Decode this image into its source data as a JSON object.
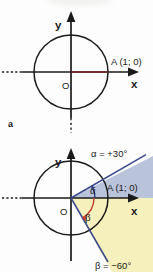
{
  "document": {
    "type": "math-figure",
    "description": "Unit circle diagrams showing point A and directed angles"
  },
  "figure_a": {
    "caption": "a",
    "axis_x_label": "x",
    "axis_y_label": "y",
    "origin_label": "O",
    "point_label": "A (1; 0)",
    "radius_color": "#7a2424",
    "circle_color": "#1a1a1a",
    "axis_color": "#1a1a1a"
  },
  "figure_b": {
    "axis_x_label": "x",
    "axis_y_label": "y",
    "origin_label": "O",
    "point_label": "A (1; 0)",
    "alpha_symbol": "α",
    "beta_symbol": "β",
    "alpha_label": "α = +30°",
    "beta_label": "β = −60°",
    "alpha_degrees": 30,
    "beta_degrees": -60,
    "alpha_sector_color": "#b9c3d9",
    "beta_sector_color": "#f6f0bc",
    "alpha_ray_color": "#3b4a8c",
    "beta_ray_color": "#3b4a8c",
    "alpha_arc_color": "#2b3a7a",
    "beta_arc_color": "#c2392b"
  }
}
